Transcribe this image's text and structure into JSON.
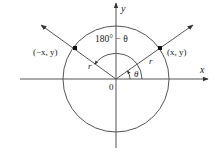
{
  "diagram": {
    "type": "unit-circle-reference-angle",
    "axes": {
      "x_label": "x",
      "y_label": "y",
      "origin_label": "0"
    },
    "points": [
      {
        "label": "(−x, y)",
        "quadrant": 2
      },
      {
        "label": "(x, y)",
        "quadrant": 1
      }
    ],
    "radius_label": "r",
    "angles": {
      "theta_label": "θ",
      "supplement_label": "180° − θ"
    },
    "colors": {
      "stroke": "#555555",
      "text": "#222222",
      "point": "#111111"
    }
  }
}
